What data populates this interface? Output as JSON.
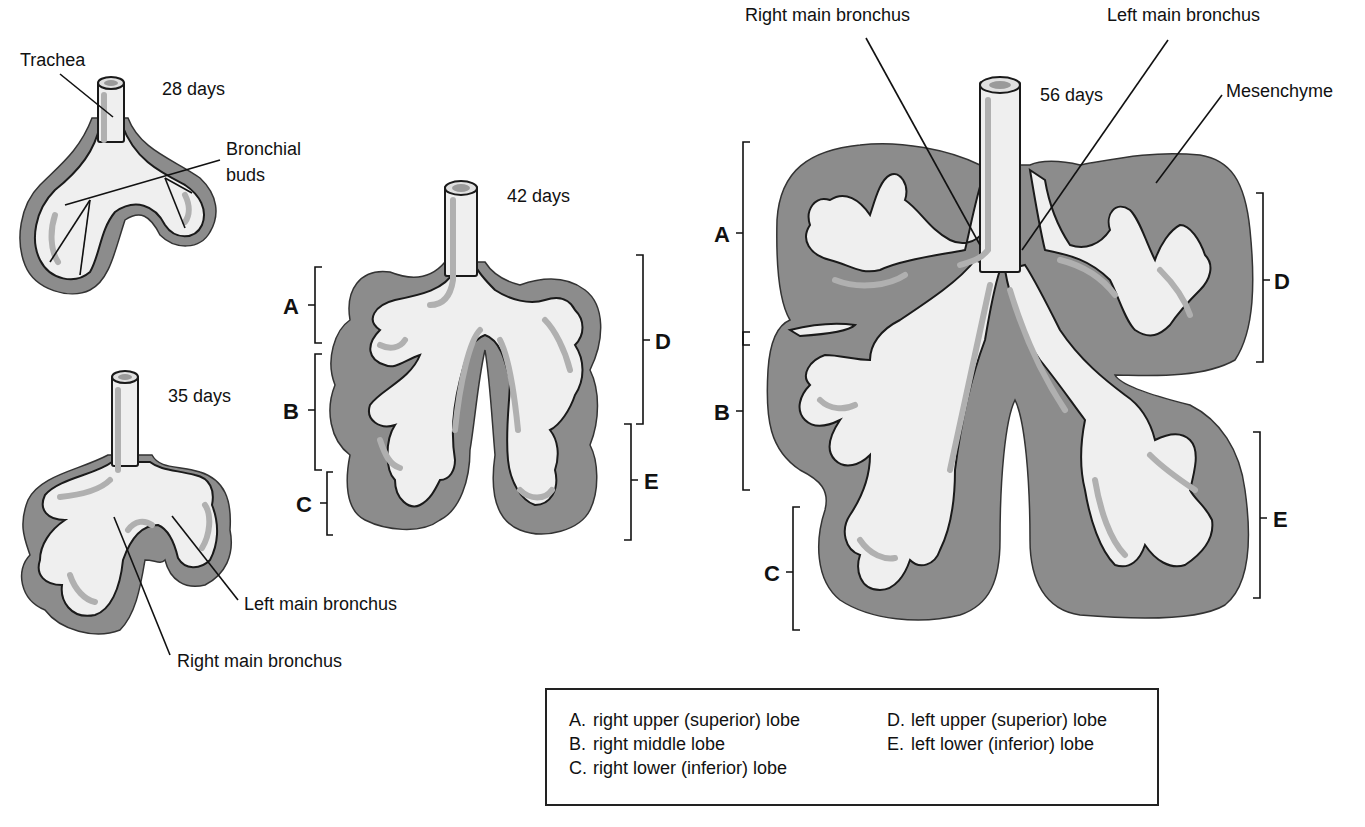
{
  "figure": {
    "colors": {
      "mesenchyme": "#8a8a8a",
      "epithelium": "#efefef",
      "outline": "#1a1a1a",
      "shade": "#b4b4b4"
    }
  },
  "stages": {
    "day28": {
      "label": "28 days",
      "callouts": {
        "trachea": "Trachea",
        "bronchial_buds_1": "Bronchial",
        "bronchial_buds_2": "buds"
      }
    },
    "day35": {
      "label": "35 days",
      "callouts": {
        "left_main_bronchus": "Left main bronchus",
        "right_main_bronchus": "Right main bronchus"
      }
    },
    "day42": {
      "label": "42 days",
      "brackets": [
        "A",
        "B",
        "C",
        "D",
        "E"
      ]
    },
    "day56": {
      "label": "56 days",
      "callouts": {
        "right_main_bronchus": "Right main bronchus",
        "left_main_bronchus": "Left main bronchus",
        "mesenchyme": "Mesenchyme"
      },
      "brackets": [
        "A",
        "B",
        "C",
        "D",
        "E"
      ]
    }
  },
  "legend": {
    "items": [
      {
        "key": "A.",
        "text": "right upper (superior) lobe"
      },
      {
        "key": "B.",
        "text": "right middle lobe"
      },
      {
        "key": "C.",
        "text": "right lower (inferior) lobe"
      },
      {
        "key": "D.",
        "text": "left upper (superior) lobe"
      },
      {
        "key": "E.",
        "text": "left lower (inferior) lobe"
      }
    ]
  }
}
